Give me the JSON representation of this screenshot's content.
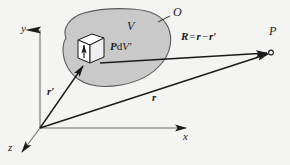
{
  "figure": {
    "kind": "vector-diagram",
    "background_color": "#f4f4f2",
    "ink_color": "#1a1a1a",
    "volume_fill_color": "#c9c9c9",
    "volume_stroke_color": "#4a4a4a"
  },
  "axes": {
    "x": {
      "label": "x"
    },
    "y": {
      "label": "y"
    },
    "z": {
      "label": "z"
    }
  },
  "labels": {
    "volume": "V",
    "surface": "O",
    "field_point": "P",
    "source_element_vector": "P",
    "source_element_d": "d",
    "source_element_volume": "V",
    "source_element_prime": "′",
    "position_vector": "r",
    "source_vector_base": "r",
    "source_vector_prime": "′"
  },
  "equation": {
    "lhs": "R",
    "equals": "=",
    "term1": "r",
    "minus": "−",
    "term2": "r",
    "prime": "′"
  }
}
